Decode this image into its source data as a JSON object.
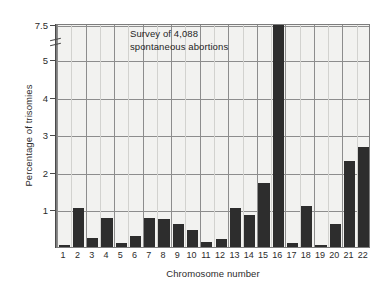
{
  "chart_data": {
    "type": "bar",
    "title": "",
    "annotation": "Survey of 4,088\nspontaneous abortions",
    "xlabel": "Chromosome number",
    "ylabel": "Percentage of trisomies",
    "categories": [
      "1",
      "2",
      "3",
      "4",
      "5",
      "6",
      "7",
      "8",
      "9",
      "10",
      "11",
      "12",
      "13",
      "14",
      "15",
      "16",
      "17",
      "18",
      "19",
      "20",
      "21",
      "22"
    ],
    "values": [
      0.05,
      1.05,
      0.25,
      0.78,
      0.1,
      0.3,
      0.78,
      0.75,
      0.6,
      0.45,
      0.13,
      0.2,
      1.05,
      0.85,
      1.7,
      7.5,
      0.1,
      1.1,
      0.05,
      0.6,
      2.3,
      2.65
    ],
    "ytick_labels": [
      "1",
      "2",
      "3",
      "4",
      "5",
      "7.5"
    ],
    "ytick_values": [
      1,
      2,
      3,
      4,
      5,
      7.5
    ],
    "ylim": [
      0,
      7.5
    ],
    "y_axis_break": true,
    "y_axis_break_between": [
      5,
      7.5
    ],
    "grid": true,
    "legend": "none",
    "bar_color": "#2d2d2d",
    "plot_background": "#f2f2f0",
    "grid_color": "#8d8d8d"
  }
}
